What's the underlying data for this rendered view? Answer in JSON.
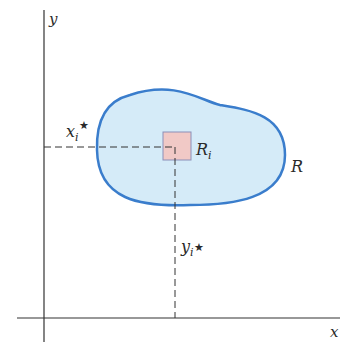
{
  "diagram": {
    "axes": {
      "x_label": "x",
      "y_label": "y"
    },
    "region": {
      "label": "R",
      "fill": "#d5ebf8",
      "stroke": "#3a7dcc"
    },
    "subrectangle": {
      "label_main": "R",
      "label_sub": "i",
      "fill": "#f1c9c6",
      "stroke": "#8b8fb8"
    },
    "sample_point": {
      "x_label_main": "x",
      "x_label_sub": "i",
      "x_label_star": "★",
      "y_label_main": "y",
      "y_label_sub": "i",
      "y_label_star": "★"
    }
  }
}
